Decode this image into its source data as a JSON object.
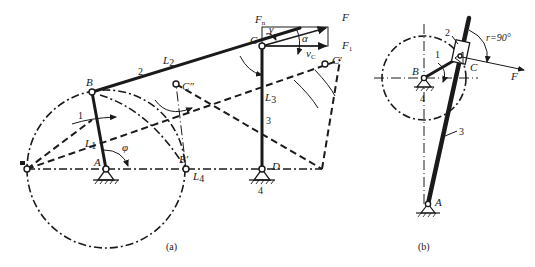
{
  "figure_a": {
    "caption": "(a)",
    "points": {
      "A": "A",
      "B": "B",
      "B_prime": "B′",
      "C": "C",
      "C_prime": "C′",
      "C_dprime": "C″",
      "D": "D"
    },
    "links": {
      "crank": "1",
      "coupler": "2",
      "rocker": "3",
      "frame": "4"
    },
    "lengths": {
      "L1": "L",
      "L1_sub": "1",
      "L2": "L",
      "L2_sub": "2",
      "L3": "L",
      "L3_sub": "3",
      "L4": "L",
      "L4_sub": "4"
    },
    "angles": {
      "phi": "φ",
      "gamma": "γ",
      "alpha": "α"
    },
    "forces": {
      "F": "F",
      "Fn": "F",
      "Fn_sub": "n",
      "F1": "F",
      "F1_sub": "1",
      "vC": "v",
      "vC_sub": "C"
    }
  },
  "figure_b": {
    "caption": "(b)",
    "points": {
      "A": "A",
      "B": "B",
      "C": "C"
    },
    "links": {
      "crank": "1",
      "slider": "2",
      "rocker": "3",
      "frame": "4"
    },
    "gamma_label": "r=90°",
    "force": "F"
  }
}
